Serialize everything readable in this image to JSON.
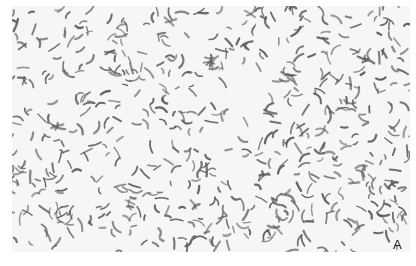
{
  "figure": {
    "type": "micrograph",
    "panel_label": "A",
    "colors": {
      "background": "#ffffff",
      "field": "#f6f6f6",
      "cells": "#5a5a5a"
    }
  }
}
